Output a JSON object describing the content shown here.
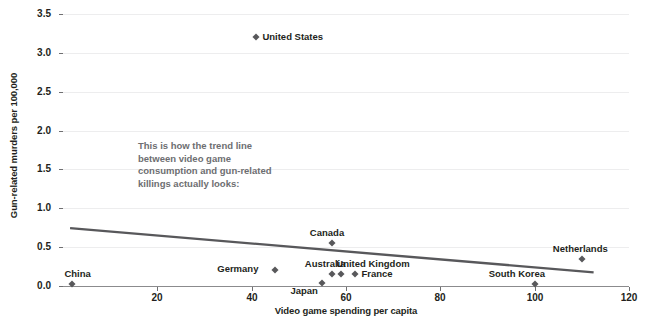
{
  "chart_data": {
    "type": "scatter",
    "title": "",
    "xlabel": "Video game spending per capita",
    "ylabel": "Gun-related murders per 100,000",
    "xlim": [
      0,
      120
    ],
    "ylim": [
      0,
      3.5
    ],
    "xticks": [
      "20",
      "40",
      "60",
      "80",
      "100",
      "120"
    ],
    "xtick_values": [
      20,
      40,
      60,
      80,
      100,
      120
    ],
    "yticks": [
      "0.0",
      "0.5",
      "1.0",
      "1.5",
      "2.0",
      "2.5",
      "3.0",
      "3.5"
    ],
    "ytick_values": [
      0.0,
      0.5,
      1.0,
      1.5,
      2.0,
      2.5,
      3.0,
      3.5
    ],
    "grid": true,
    "legend": "none",
    "points": [
      {
        "label": "China",
        "x": 2,
        "y": 0.02,
        "label_dx": -8,
        "label_dy": -15,
        "label_align": "left"
      },
      {
        "label": "United States",
        "x": 41,
        "y": 3.21,
        "label_dx": 6,
        "label_dy": -5,
        "label_align": "left"
      },
      {
        "label": "Germany",
        "x": 45,
        "y": 0.2,
        "label_dx": -58,
        "label_dy": -6,
        "label_align": "left"
      },
      {
        "label": "Japan",
        "x": 55,
        "y": 0.04,
        "label_dx": -32,
        "label_dy": 3,
        "label_align": "left"
      },
      {
        "label": "Australia",
        "x": 57,
        "y": 0.15,
        "label_dx": -27,
        "label_dy": -15,
        "label_align": "left"
      },
      {
        "label": "Canada",
        "x": 57,
        "y": 0.55,
        "label_dx": -22,
        "label_dy": -15,
        "label_align": "left"
      },
      {
        "label": "United Kingdom",
        "x": 59,
        "y": 0.15,
        "label_dx": -5,
        "label_dy": -15,
        "label_align": "left"
      },
      {
        "label": "France",
        "x": 62,
        "y": 0.15,
        "label_dx": 6,
        "label_dy": -5,
        "label_align": "left"
      },
      {
        "label": "South Korea",
        "x": 100,
        "y": 0.02,
        "label_dx": -46,
        "label_dy": -15,
        "label_align": "left"
      },
      {
        "label": "Netherlands",
        "x": 110,
        "y": 0.35,
        "label_dx": -29,
        "label_dy": -15,
        "label_align": "left"
      }
    ],
    "trendline": {
      "x_start": 1.5,
      "y_start": 0.745,
      "x_end": 112.5,
      "y_end": 0.175,
      "color": "#58585b"
    },
    "annotation": {
      "text": "This is how the trend line between video game consumption and gun-related killings actually looks:",
      "color": "#6d6e71"
    },
    "marker_color": "#58585b",
    "grid_color": "#ededee",
    "axis_color": "#8b8b8d"
  }
}
